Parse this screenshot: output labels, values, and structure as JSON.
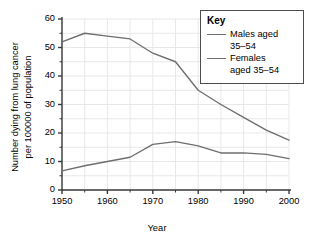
{
  "chart_data": {
    "type": "line",
    "title": "",
    "xlabel": "Year",
    "ylabel": "Number dying from lung cancer per 100000 of population",
    "ylabel_line1": "Number dying from lung cancer",
    "ylabel_line2": "per 100000 of population",
    "xlim": [
      1950,
      2000
    ],
    "ylim": [
      0,
      60
    ],
    "xticks": [
      1950,
      1960,
      1970,
      1980,
      1990,
      2000
    ],
    "xtick_labels": [
      "1950",
      "1960",
      "1970",
      "1980",
      "1990",
      "2000"
    ],
    "xminor_step": 5,
    "yticks": [
      0,
      10,
      20,
      30,
      40,
      50,
      60
    ],
    "ytick_labels": [
      "0",
      "10",
      "20",
      "30",
      "40",
      "50",
      "60"
    ],
    "yminor_step": 5,
    "grid": true,
    "grid_color": "#e8e8e8",
    "legend_position": "upper right",
    "legend_title": "Key",
    "line_color": "#6e6e6e",
    "axis_color": "#3a3a3a",
    "x": [
      1950,
      1955,
      1960,
      1965,
      1970,
      1975,
      1980,
      1985,
      1990,
      1995,
      2000
    ],
    "series": [
      {
        "name": "Males aged 35–54",
        "label_line1": "Males aged",
        "label_line2": "35–54",
        "color": "#6e6e6e",
        "values": [
          52,
          55,
          54,
          53,
          48,
          45,
          35,
          30,
          25.5,
          21,
          17.5
        ]
      },
      {
        "name": "Females aged 35–54",
        "label_line1": "Females",
        "label_line2": "aged 35–54",
        "color": "#6e6e6e",
        "values": [
          6.7,
          8.5,
          10,
          11.5,
          16,
          17,
          15.5,
          13,
          13,
          12.5,
          11
        ]
      }
    ]
  }
}
